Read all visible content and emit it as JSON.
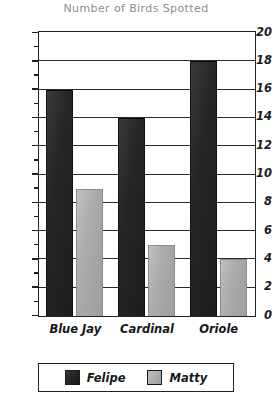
{
  "chart_data": {
    "type": "bar",
    "title": "Number of Birds Spotted",
    "xlabel": "",
    "ylabel": "",
    "categories": [
      "Blue Jay",
      "Cardinal",
      "Oriole"
    ],
    "series": [
      {
        "name": "Felipe",
        "color": "#262626",
        "values": [
          16,
          14,
          18
        ]
      },
      {
        "name": "Matty",
        "color": "#ababab",
        "values": [
          9,
          5,
          4
        ]
      }
    ],
    "ylim": [
      0,
      20
    ],
    "ytick_step": 2,
    "yticks": [
      0,
      2,
      4,
      6,
      8,
      10,
      12,
      14,
      16,
      18,
      20
    ],
    "ytick_labels": [
      "0",
      "2",
      "4",
      "6",
      "8",
      "10",
      "12",
      "14",
      "16",
      "18",
      "20"
    ],
    "yticks_minor": [
      1,
      3,
      5,
      7,
      9,
      11,
      13,
      15,
      17,
      19
    ],
    "grid": true,
    "grid_axis": "y",
    "legend_position": "bottom",
    "legend_entries": [
      "Felipe",
      "Matty"
    ]
  }
}
